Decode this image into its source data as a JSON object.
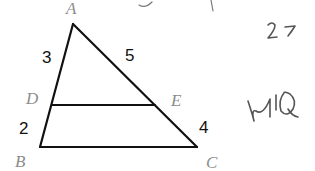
{
  "diagram": {
    "type": "triangle-with-parallel-segment",
    "colors": {
      "line": "#111111",
      "vertex_label": "#8c8c8c",
      "number_label": "#111111",
      "handwriting": "#555555",
      "background": "#ffffff"
    },
    "vertices": {
      "A": {
        "label": "A",
        "x": 73,
        "y": 24
      },
      "B": {
        "label": "B",
        "x": 40,
        "y": 147
      },
      "C": {
        "label": "C",
        "x": 197,
        "y": 147
      },
      "D": {
        "label": "D",
        "x": 52,
        "y": 105
      },
      "E": {
        "label": "E",
        "x": 155,
        "y": 105
      }
    },
    "segments": [
      {
        "from": "A",
        "to": "B"
      },
      {
        "from": "A",
        "to": "C"
      },
      {
        "from": "B",
        "to": "C"
      },
      {
        "from": "D",
        "to": "E"
      }
    ],
    "lengths": {
      "AD": "3",
      "AE": "5",
      "DB": "2",
      "EC": "4"
    },
    "handwriting": {
      "top_note": "2 7",
      "side_note": "NIQ"
    }
  }
}
